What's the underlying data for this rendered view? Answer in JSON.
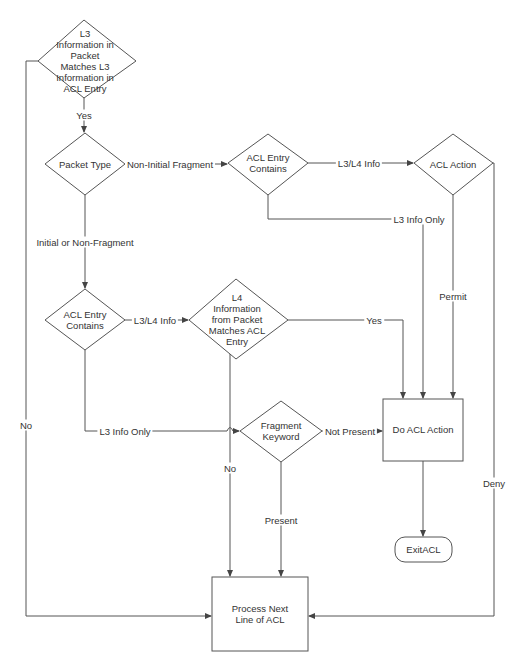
{
  "diagram": {
    "type": "flowchart",
    "colors": {
      "stroke": "#555555",
      "text": "#333333",
      "background": "#ffffff"
    },
    "nodes": {
      "l3_match": {
        "shape": "diamond",
        "label": "L3 Information in Packet Matches L3 Information in ACL Entry"
      },
      "packet_type": {
        "shape": "diamond",
        "label": "Packet Type"
      },
      "acl_entry_contains_top": {
        "shape": "diamond",
        "label": "ACL Entry Contains"
      },
      "acl_action": {
        "shape": "diamond",
        "label": "ACL Action"
      },
      "acl_entry_contains_mid": {
        "shape": "diamond",
        "label": "ACL Entry Contains"
      },
      "l4_match": {
        "shape": "diamond",
        "label": "L4 Information from Packet Matches ACL Entry"
      },
      "fragment_keyword": {
        "shape": "diamond",
        "label": "Fragment Keyword"
      },
      "do_acl_action": {
        "shape": "rectangle",
        "label": "Do ACL Action"
      },
      "exit_acl": {
        "shape": "terminator",
        "label": "ExitACL"
      },
      "process_next_line": {
        "shape": "rectangle",
        "label": "Process Next Line of ACL"
      }
    },
    "edges": {
      "yes_top": {
        "from": "l3_match",
        "to": "packet_type",
        "label": "Yes"
      },
      "no_left": {
        "from": "l3_match",
        "to": "process_next_line",
        "label": "No"
      },
      "non_initial_fragment": {
        "from": "packet_type",
        "to": "acl_entry_contains_top",
        "label": "Non-Initial Fragment"
      },
      "initial_or_non_fragment": {
        "from": "packet_type",
        "to": "acl_entry_contains_mid",
        "label": "Initial or Non-Fragment"
      },
      "l3l4_info_top": {
        "from": "acl_entry_contains_top",
        "to": "acl_action",
        "label": "L3/L4 Info"
      },
      "l3_info_only_top": {
        "from": "acl_entry_contains_top",
        "to": "do_acl_action",
        "label": "L3 Info Only"
      },
      "permit": {
        "from": "acl_action",
        "to": "do_acl_action",
        "label": "Permit"
      },
      "deny": {
        "from": "acl_action",
        "to": "process_next_line",
        "label": "Deny"
      },
      "l3l4_info_mid": {
        "from": "acl_entry_contains_mid",
        "to": "l4_match",
        "label": "L3/L4 Info"
      },
      "l3_info_only_mid": {
        "from": "acl_entry_contains_mid",
        "to": "fragment_keyword",
        "label": "L3 Info Only"
      },
      "l4_yes": {
        "from": "l4_match",
        "to": "do_acl_action",
        "label": "Yes"
      },
      "l4_no": {
        "from": "l4_match",
        "to": "process_next_line",
        "label": "No"
      },
      "not_present": {
        "from": "fragment_keyword",
        "to": "do_acl_action",
        "label": "Not Present"
      },
      "present": {
        "from": "fragment_keyword",
        "to": "process_next_line",
        "label": "Present"
      },
      "do_to_exit": {
        "from": "do_acl_action",
        "to": "exit_acl",
        "label": ""
      }
    }
  }
}
